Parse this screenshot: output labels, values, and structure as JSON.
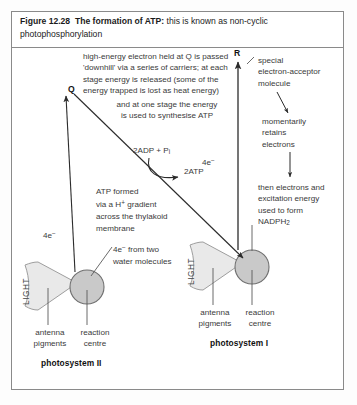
{
  "figure": {
    "number": "Figure 12.28",
    "title_bold": "The formation of ATP:",
    "title_rest": " this is known as non-cyclic photophosphorylation"
  },
  "annotations": {
    "q_label": "Q",
    "r_label": "R",
    "downhill_text": "high-energy electron held at Q is passed\n'downhill' via a series of carriers; at each\nstage energy is released (some of the\nenergy trapped is lost as heat energy)",
    "synthesise_text": "and at one stage the energy\nis used to synthesise ATP",
    "acceptor_text": "special\nelectron-acceptor\nmolecule",
    "retains_text": "momentarily\nretains\nelectrons",
    "nadph_text": "then electrons and\nexcitation energy\nused to form\nNADPH",
    "nadph_sub": "2",
    "adp_label_main": "2ADP + P",
    "adp_label_sub": "i",
    "atp_label": "2ATP",
    "atp_gradient_text": "ATP formed\nvia a H",
    "atp_gradient_sup": "+",
    "atp_gradient_text2": " gradient\nacross the thylakoid\nmembrane",
    "electrons_left": "4e",
    "electrons_left_sup": "−",
    "electrons_right": "4e",
    "electrons_right_sup": "−",
    "water_label_lead": "4e",
    "water_label_sup": "−",
    "water_label_rest": " from two\nwater molecules"
  },
  "photosystem_two": {
    "name": "photosystem II",
    "light_label": "LIGHT",
    "antenna_label": "antenna\npigments",
    "reaction_label": "reaction\ncentre"
  },
  "photosystem_one": {
    "name": "photosystem I",
    "light_label": "LIGHT",
    "antenna_label": "antenna\npigments",
    "reaction_label": "reaction\ncentre"
  },
  "colors": {
    "frame_border": "#8a8a8a",
    "antenna_fill": "#e8e8e8",
    "antenna_stroke": "#9a9a9a",
    "reaction_fill": "#c6c6c6",
    "reaction_stroke": "#6f6f6f",
    "line": "#3a3a3a",
    "text": "#1b1b1b"
  },
  "diagram_data": {
    "type": "diagram",
    "subject": "non-cyclic photophosphorylation (Z-scheme) electron flow",
    "nodes": [
      {
        "id": "photosystem-II",
        "label": "photosystem II",
        "x": 75,
        "y": 288
      },
      {
        "id": "photosystem-I",
        "label": "photosystem I",
        "x": 240,
        "y": 268
      },
      {
        "id": "Q",
        "label": "Q",
        "x": 68,
        "y": 88
      },
      {
        "id": "R",
        "label": "R",
        "x": 238,
        "y": 53
      }
    ],
    "flows": [
      {
        "from": "photosystem-II",
        "to": "Q",
        "label": "4e− excited"
      },
      {
        "from": "Q",
        "to": "photosystem-I",
        "label": "downhill via carriers, ATP formed"
      },
      {
        "from": "photosystem-I",
        "to": "R",
        "label": "4e− excited"
      },
      {
        "from": "R",
        "to": "NADPH2",
        "label": "momentarily retains electrons"
      }
    ]
  }
}
